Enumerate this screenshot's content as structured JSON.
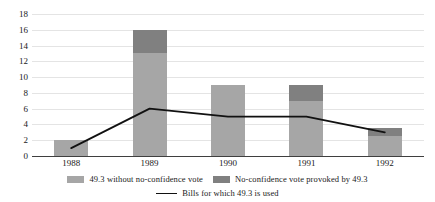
{
  "chart_data": {
    "type": "bar",
    "title": "",
    "subtitle": "",
    "xlabel": "",
    "ylabel": "",
    "categories": [
      "1988",
      "1989",
      "1990",
      "1991",
      "1992"
    ],
    "ylim": [
      0,
      18
    ],
    "ytick_step": 2,
    "yticks": [
      "18",
      "16",
      "14",
      "12",
      "10",
      "8",
      "6",
      "4",
      "2",
      "0"
    ],
    "grid": true,
    "legend_position": "bottom",
    "stacked": true,
    "series": [
      {
        "name": "49.3 without no-confidence vote",
        "type": "bar",
        "color": "#a6a6a6",
        "values": [
          2,
          13,
          9,
          7,
          2.5
        ]
      },
      {
        "name": "No-confidence vote provoked by 49.3",
        "type": "bar",
        "color": "#808080",
        "values": [
          0,
          3,
          0,
          2,
          1
        ]
      },
      {
        "name": "Bills for which 49.3 is used",
        "type": "line",
        "color": "#111111",
        "values": [
          1,
          6,
          5,
          5,
          3
        ]
      }
    ],
    "totals": [
      2,
      16,
      9,
      9,
      3.5
    ]
  },
  "legend": {
    "items": [
      {
        "label": "49.3 without no-confidence vote",
        "marker": "swatch-light-icon"
      },
      {
        "label": "No-confidence vote provoked by 49.3",
        "marker": "swatch-dark-icon"
      },
      {
        "label": "Bills for which 49.3 is used",
        "marker": "line-marker-icon"
      }
    ]
  }
}
